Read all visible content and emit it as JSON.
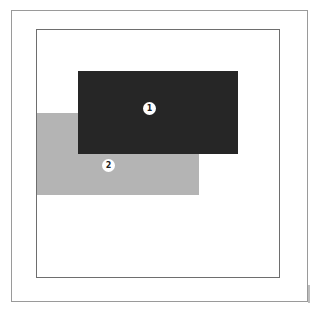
{
  "diagram": {
    "colors": {
      "layer1": "#262626",
      "layer2": "#b4b4b4",
      "frame": "#6e6e6e"
    },
    "layers": [
      {
        "label": "1",
        "name": "front-layer"
      },
      {
        "label": "2",
        "name": "back-layer"
      }
    ]
  }
}
